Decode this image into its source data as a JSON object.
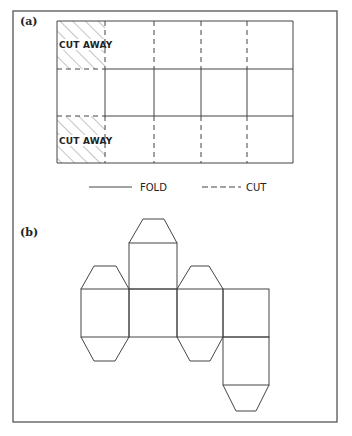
{
  "figure": {
    "panel_a": {
      "label": "(a)",
      "cut_away_label_top": "CUT AWAY",
      "cut_away_label_bottom": "CUT AWAY",
      "grid": {
        "rows": 3,
        "columns": 5
      }
    },
    "legend": {
      "fold_label": "FOLD",
      "cut_label": "CUT"
    },
    "panel_b": {
      "label": "(b)",
      "description": "Unfolded net of a hexagonal-ended prism"
    }
  }
}
